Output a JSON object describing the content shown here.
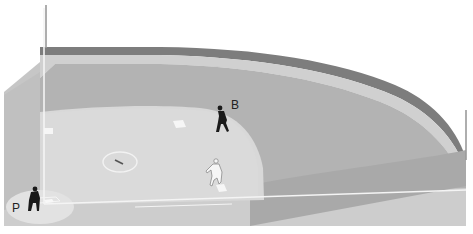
{
  "diagram": {
    "labels": {
      "batter_runner": "B",
      "pitcher": "P"
    },
    "figures": [
      {
        "id": "fielder-b",
        "label": "B",
        "style": "solid-black",
        "position": "between first and second base, edge of infield grass"
      },
      {
        "id": "fielder-p",
        "label": "P",
        "style": "solid-black",
        "position": "covering home plate area"
      },
      {
        "id": "runner",
        "label": "",
        "style": "white-outline",
        "position": "near third base"
      }
    ],
    "field_elements": [
      "home plate",
      "first base",
      "second base",
      "third base",
      "pitcher's mound",
      "foul lines",
      "outfield warning track",
      "outfield wall",
      "foul poles"
    ],
    "colors": {
      "background": "#ffffff",
      "outfield_grass": "#b4b4b4",
      "infield_dirt": "#d9d9d9",
      "warning_track": "#cfcfcf",
      "wall": "#7a7a7a",
      "foul_ground": "#c8c8c8",
      "foul_lines": "#f4f4f4",
      "figure_dark": "#1a1a1a"
    }
  }
}
